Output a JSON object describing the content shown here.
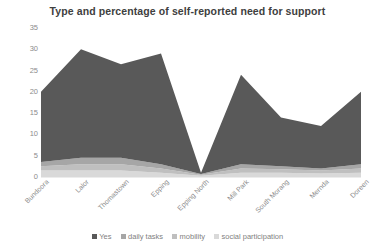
{
  "chart_data": {
    "type": "area",
    "stacked": true,
    "title": "Type and percentage of self-reported need for support",
    "xlabel": "",
    "ylabel": "",
    "ylim": [
      0,
      35
    ],
    "yticks": [
      0,
      5,
      10,
      15,
      20,
      25,
      30,
      35
    ],
    "grid": false,
    "legend_position": "bottom",
    "categories": [
      "Bundoora",
      "Lalor",
      "Thomastown",
      "Epping",
      "Epping North",
      "Mill Park",
      "South Morang",
      "Mernda",
      "Doreen"
    ],
    "series": [
      {
        "name": "social participation",
        "color": "#d9d9d9",
        "values": [
          1.5,
          1.5,
          1.5,
          1.0,
          0.3,
          1.0,
          1.0,
          0.8,
          1.0
        ]
      },
      {
        "name": "mobility",
        "color": "#bfbfbf",
        "values": [
          1.0,
          1.5,
          1.5,
          1.0,
          0.2,
          1.0,
          0.8,
          0.7,
          1.0
        ]
      },
      {
        "name": "daily tasks",
        "color": "#a6a6a6",
        "values": [
          1.0,
          1.5,
          1.5,
          1.0,
          0.2,
          1.0,
          0.7,
          0.5,
          1.0
        ]
      },
      {
        "name": "Yes",
        "color": "#595959",
        "values": [
          16.5,
          25.5,
          22.0,
          26.0,
          0.3,
          21.0,
          11.5,
          10.0,
          17.0
        ]
      }
    ],
    "totals": [
      20.0,
      30.0,
      26.5,
      29.0,
      1.0,
      24.0,
      14.0,
      12.0,
      20.0
    ]
  },
  "legend": {
    "items": [
      {
        "label": "Yes",
        "color": "#595959"
      },
      {
        "label": "daily tasks",
        "color": "#a6a6a6"
      },
      {
        "label": "mobility",
        "color": "#bfbfbf"
      },
      {
        "label": "social participation",
        "color": "#d9d9d9"
      }
    ]
  }
}
